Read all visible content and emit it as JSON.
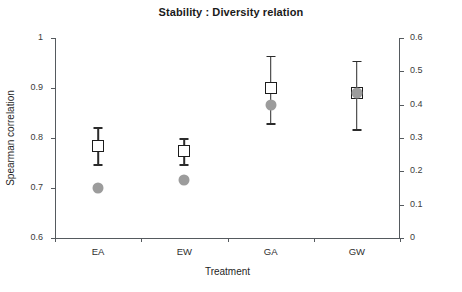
{
  "chart_data": {
    "type": "scatter",
    "title": "Stability : Diversity relation",
    "xlabel": "Treatment",
    "ylabel": "Spearman correlation",
    "ylabel_right": "Slope of non-linear regression",
    "categories": [
      "EA",
      "EW",
      "GA",
      "GW"
    ],
    "ylim": [
      0.6,
      1.0
    ],
    "yticks": [
      "0.6",
      "0.7",
      "0.8",
      "0.9",
      "1"
    ],
    "ytick_values": [
      0.6,
      0.7,
      0.8,
      0.9,
      1.0
    ],
    "ylim_right": [
      0,
      0.6
    ],
    "yticks_right": [
      "0",
      "0.1",
      "0.2",
      "0.3",
      "0.4",
      "0.5",
      "0.6"
    ],
    "ytick_values_right": [
      0,
      0.1,
      0.2,
      0.3,
      0.4,
      0.5,
      0.6
    ],
    "grid": false,
    "legend": "none",
    "series": [
      {
        "name": "Spearman correlation",
        "axis": "left",
        "marker": "open-square",
        "color": "#1c1c1c",
        "values": [
          0.785,
          0.775,
          0.9,
          0.89
        ],
        "err_low": [
          0.748,
          0.748,
          0.83,
          0.818
        ],
        "err_high": [
          0.822,
          0.8,
          0.965,
          0.955
        ]
      },
      {
        "name": "Slope of non-linear regression",
        "axis": "right",
        "marker": "filled-circle",
        "color": "#9c9c9c",
        "values": [
          0.15,
          0.174,
          0.4,
          0.435
        ]
      }
    ]
  }
}
